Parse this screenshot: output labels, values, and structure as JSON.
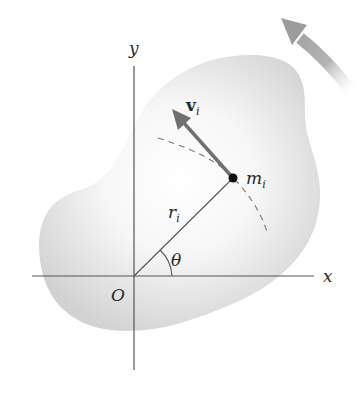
{
  "figure": {
    "labels": {
      "y_axis": "y",
      "x_axis": "x",
      "origin": "O",
      "radius": "r",
      "radius_sub": "i",
      "angle": "θ",
      "velocity": "v",
      "velocity_sub": "i",
      "mass": "m",
      "mass_sub": "i"
    },
    "colors": {
      "body_fill_edge": "#d4d4d4",
      "body_fill_center": "#ffffff",
      "axis_line": "#555555",
      "velocity_arrow": "#707070",
      "rotation_arrow": "#a8a8a8",
      "mass_point": "#111111",
      "dashed_path": "#777777"
    }
  }
}
